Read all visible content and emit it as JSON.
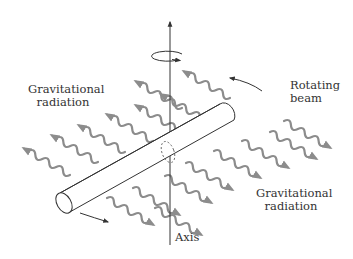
{
  "diagram": {
    "labels": {
      "gravitational_radiation_left": [
        "Gravitational",
        "radiation"
      ],
      "rotating_beam": [
        "Rotating",
        "beam"
      ],
      "gravitational_radiation_right": [
        "Gravitational",
        "radiation"
      ],
      "axis": "Axis"
    },
    "colors": {
      "wave": "#8c8c8c",
      "line": "#333333",
      "text": "#333333",
      "background": "#ffffff"
    },
    "icons": {
      "rotation": "rotation-ellipse-arrow-icon",
      "axis_arrow": "arrow-up-icon",
      "beam_rotation_arrows": "curved-arrow-icon",
      "waves": "wavy-arrow-icon"
    }
  }
}
